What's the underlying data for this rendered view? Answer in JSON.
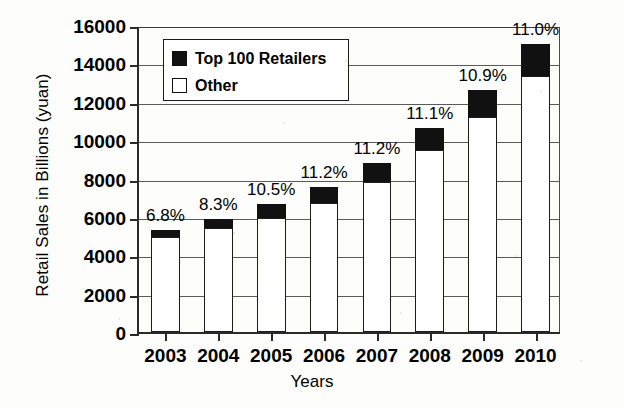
{
  "chart_data": {
    "type": "bar",
    "title": "",
    "subtitle": "",
    "xlabel": "Years",
    "ylabel": "Retail Sales in Billions (yuan)",
    "categories": [
      "2003",
      "2004",
      "2005",
      "2006",
      "2007",
      "2008",
      "2009",
      "2010"
    ],
    "ylim": [
      0,
      16000
    ],
    "yticks": [
      0,
      2000,
      4000,
      6000,
      8000,
      10000,
      12000,
      14000,
      16000
    ],
    "ytick_labels": [
      "0",
      "2000",
      "4000",
      "6000",
      "8000",
      "10000",
      "12000",
      "14000",
      "16000"
    ],
    "grid": true,
    "stacked": true,
    "legend_position": "upper-left-inside",
    "series": [
      {
        "name": "Other",
        "color": "#ffffff",
        "values": [
          4940,
          5410,
          5950,
          6705,
          7815,
          9468,
          11227,
          13350
        ]
      },
      {
        "name": "Top 100 Retailers",
        "color": "#111111",
        "values": [
          360,
          490,
          700,
          845,
          985,
          1182,
          1373,
          1650
        ]
      }
    ],
    "totals": [
      5300,
      5900,
      6650,
      7550,
      8800,
      10650,
      12600,
      15000
    ],
    "annotations": [
      "6.8%",
      "8.3%",
      "10.5%",
      "11.2%",
      "11.2%",
      "11.1%",
      "10.9%",
      "11.0%"
    ],
    "annotation_note": "Top 100 Retailers share of total retail sales"
  },
  "legend": {
    "items": [
      {
        "label": "Top 100 Retailers",
        "swatch": "filled"
      },
      {
        "label": "Other",
        "swatch": "hollow"
      }
    ]
  }
}
